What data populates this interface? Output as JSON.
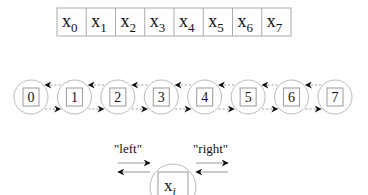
{
  "array": {
    "cells": [
      {
        "base": "x",
        "sub": "0"
      },
      {
        "base": "x",
        "sub": "1"
      },
      {
        "base": "x",
        "sub": "2"
      },
      {
        "base": "x",
        "sub": "3"
      },
      {
        "base": "x",
        "sub": "4"
      },
      {
        "base": "x",
        "sub": "5"
      },
      {
        "base": "x",
        "sub": "6"
      },
      {
        "base": "x",
        "sub": "7"
      }
    ]
  },
  "list": {
    "nodes": [
      "0",
      "1",
      "2",
      "3",
      "4",
      "5",
      "6",
      "7"
    ]
  },
  "legend": {
    "left_label": "\"left\"",
    "right_label": "\"right\"",
    "node_base": "x",
    "node_sub": "i"
  },
  "colors": {
    "stroke": "#999999",
    "circle": "#bbbbbb",
    "arrow": "#111111",
    "text": "#111111"
  }
}
